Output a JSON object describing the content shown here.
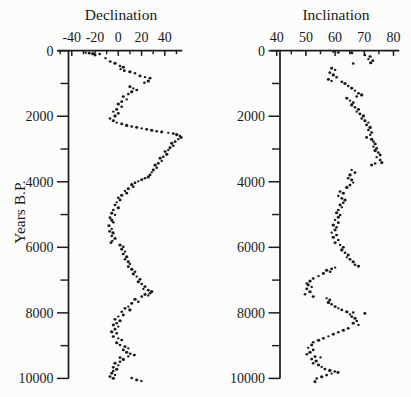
{
  "figure": {
    "background": "#fcfcfb",
    "ink_color": "#1a1a1a"
  },
  "chart_data": [
    {
      "type": "scatter",
      "title": "Declination",
      "ylabel": "Years B.P.",
      "marker": "dot",
      "x_ticks_major": [
        -40,
        -20,
        0,
        20,
        40
      ],
      "x_ticks_minor": [
        -50,
        -30,
        -10,
        10,
        30,
        50
      ],
      "x_range": [
        -52,
        55
      ],
      "y_ticks_major": [
        0,
        2000,
        4000,
        6000,
        8000,
        10000
      ],
      "y_ticks_minor": [
        1000,
        3000,
        5000,
        7000,
        9000
      ],
      "y_range": [
        0,
        10000
      ],
      "y_axis_side": "left",
      "grid": false,
      "points": [
        [
          -28,
          60
        ],
        [
          -25,
          75
        ],
        [
          -22,
          90
        ],
        [
          -16,
          100
        ],
        [
          -20,
          135
        ],
        [
          -11,
          230
        ],
        [
          -7,
          330
        ],
        [
          -2.8,
          385
        ],
        [
          1.5,
          465
        ],
        [
          4.3,
          505
        ],
        [
          2,
          565
        ],
        [
          5.2,
          610
        ],
        [
          10,
          640
        ],
        [
          14.4,
          690
        ],
        [
          18.7,
          770
        ],
        [
          23,
          810
        ],
        [
          27.3,
          840
        ],
        [
          25.8,
          925
        ],
        [
          22.4,
          975
        ],
        [
          10,
          1100
        ],
        [
          12.9,
          1150
        ],
        [
          15.8,
          1200
        ],
        [
          11.5,
          1250
        ],
        [
          8.6,
          1320
        ],
        [
          4.3,
          1400
        ],
        [
          7.2,
          1485
        ],
        [
          2.9,
          1555
        ],
        [
          0,
          1625
        ],
        [
          2.9,
          1710
        ],
        [
          -1.4,
          1790
        ],
        [
          -4.3,
          1860
        ],
        [
          0,
          1910
        ],
        [
          -2.8,
          1990
        ],
        [
          -7.1,
          2065
        ],
        [
          -4.3,
          2135
        ],
        [
          -1.4,
          2195
        ],
        [
          2.9,
          2235
        ],
        [
          7.2,
          2280
        ],
        [
          11.5,
          2310
        ],
        [
          15.8,
          2340
        ],
        [
          20.1,
          2370
        ],
        [
          24.4,
          2400
        ],
        [
          28.7,
          2430
        ],
        [
          33,
          2460
        ],
        [
          37.3,
          2480
        ],
        [
          43,
          2505
        ],
        [
          47.3,
          2530
        ],
        [
          50.2,
          2560
        ],
        [
          53,
          2600
        ],
        [
          54,
          2650
        ],
        [
          51.6,
          2700
        ],
        [
          48.8,
          2775
        ],
        [
          45.9,
          2825
        ],
        [
          47.3,
          2900
        ],
        [
          44.5,
          2960
        ],
        [
          43,
          3030
        ],
        [
          40.2,
          3080
        ],
        [
          41.6,
          3160
        ],
        [
          38.7,
          3235
        ],
        [
          35.9,
          3285
        ],
        [
          37.3,
          3365
        ],
        [
          34.4,
          3435
        ],
        [
          31.6,
          3490
        ],
        [
          33,
          3570
        ],
        [
          30.1,
          3640
        ],
        [
          28.7,
          3710
        ],
        [
          27.3,
          3790
        ],
        [
          25.8,
          3850
        ],
        [
          23,
          3895
        ],
        [
          20.1,
          3940
        ],
        [
          17.2,
          3985
        ],
        [
          14.4,
          4030
        ],
        [
          11.5,
          4085
        ],
        [
          12.9,
          4150
        ],
        [
          8.6,
          4210
        ],
        [
          5.8,
          4280
        ],
        [
          7.2,
          4350
        ],
        [
          2.9,
          4410
        ],
        [
          0,
          4485
        ],
        [
          1.5,
          4555
        ],
        [
          -1.4,
          4625
        ],
        [
          -2.8,
          4710
        ],
        [
          0,
          4790
        ],
        [
          -4.3,
          4860
        ],
        [
          -5.7,
          4960
        ],
        [
          -2.8,
          5010
        ],
        [
          -7.1,
          5095
        ],
        [
          -5.7,
          5170
        ],
        [
          -4.3,
          5235
        ],
        [
          -8,
          5340
        ],
        [
          -5.7,
          5440
        ],
        [
          -7.5,
          5510
        ],
        [
          -4.6,
          5560
        ],
        [
          -5.7,
          5650
        ],
        [
          -2.8,
          5730
        ],
        [
          -5.1,
          5800
        ],
        [
          -6.3,
          5860
        ],
        [
          1.5,
          5930
        ],
        [
          4.3,
          5980
        ],
        [
          2.9,
          6060
        ],
        [
          5.8,
          6135
        ],
        [
          4.3,
          6205
        ],
        [
          7.2,
          6285
        ],
        [
          5.8,
          6365
        ],
        [
          8.6,
          6440
        ],
        [
          10,
          6510
        ],
        [
          8.6,
          6590
        ],
        [
          11.5,
          6670
        ],
        [
          14.4,
          6745
        ],
        [
          12.9,
          6815
        ],
        [
          15.8,
          6895
        ],
        [
          18.7,
          6975
        ],
        [
          17.2,
          7050
        ],
        [
          20.1,
          7120
        ],
        [
          23,
          7200
        ],
        [
          21.5,
          7270
        ],
        [
          25.8,
          7310
        ],
        [
          28.7,
          7350
        ],
        [
          27.3,
          7400
        ],
        [
          23,
          7440
        ],
        [
          25.8,
          7470
        ],
        [
          20.1,
          7505
        ],
        [
          14.4,
          7585
        ],
        [
          17.2,
          7660
        ],
        [
          11.5,
          7710
        ],
        [
          8.6,
          7810
        ],
        [
          5.8,
          7860
        ],
        [
          10,
          7910
        ],
        [
          2.9,
          7965
        ],
        [
          4.3,
          8065
        ],
        [
          0,
          8115
        ],
        [
          -2.8,
          8195
        ],
        [
          1.5,
          8240
        ],
        [
          -1.4,
          8320
        ],
        [
          -4.3,
          8370
        ],
        [
          0,
          8420
        ],
        [
          -2.8,
          8500
        ],
        [
          -5.7,
          8575
        ],
        [
          -1.4,
          8625
        ],
        [
          -4.3,
          8725
        ],
        [
          0,
          8775
        ],
        [
          2.9,
          8830
        ],
        [
          -1.4,
          8910
        ],
        [
          1.5,
          8980
        ],
        [
          5.8,
          9030
        ],
        [
          8.6,
          9080
        ],
        [
          4.3,
          9130
        ],
        [
          7.2,
          9200
        ],
        [
          10.3,
          9250
        ],
        [
          13.8,
          9290
        ],
        [
          8.6,
          9330
        ],
        [
          1.5,
          9365
        ],
        [
          4.3,
          9420
        ],
        [
          1.5,
          9490
        ],
        [
          -2.8,
          9540
        ],
        [
          0,
          9600
        ],
        [
          -4.3,
          9660
        ],
        [
          -1.4,
          9720
        ],
        [
          -4.3,
          9770
        ],
        [
          -5.7,
          9845
        ],
        [
          -2.8,
          9895
        ],
        [
          -7.1,
          9945
        ],
        [
          -4.3,
          9995
        ],
        [
          11.5,
          9990
        ],
        [
          15.8,
          10050
        ],
        [
          19.8,
          10080
        ]
      ]
    },
    {
      "type": "scatter",
      "title": "Inclination",
      "ylabel": "",
      "marker": "dot",
      "x_ticks_major": [
        40,
        50,
        60,
        70,
        80
      ],
      "x_ticks_minor": [
        45,
        55,
        65,
        75
      ],
      "x_range": [
        38,
        82
      ],
      "y_ticks_major": [
        0,
        2000,
        4000,
        6000,
        8000,
        10000
      ],
      "y_ticks_minor": [
        1000,
        3000,
        5000,
        7000,
        9000
      ],
      "y_range": [
        0,
        10000
      ],
      "y_axis_side": "left",
      "grid": false,
      "points": [
        [
          59.4,
          30
        ],
        [
          61.1,
          55
        ],
        [
          65.7,
          65
        ],
        [
          70.2,
          130
        ],
        [
          72,
          180
        ],
        [
          71.4,
          260
        ],
        [
          72.9,
          305
        ],
        [
          72.2,
          365
        ],
        [
          66.2,
          390
        ],
        [
          58.8,
          535
        ],
        [
          60,
          590
        ],
        [
          58.2,
          670
        ],
        [
          59.4,
          740
        ],
        [
          60.5,
          810
        ],
        [
          57.7,
          875
        ],
        [
          58.8,
          925
        ],
        [
          62.3,
          950
        ],
        [
          63.4,
          1000
        ],
        [
          64.5,
          1075
        ],
        [
          65.7,
          1145
        ],
        [
          66.8,
          1220
        ],
        [
          68,
          1300
        ],
        [
          69.1,
          1350
        ],
        [
          67.4,
          1400
        ],
        [
          64,
          1450
        ],
        [
          65.1,
          1525
        ],
        [
          66.2,
          1585
        ],
        [
          65.7,
          1655
        ],
        [
          66.8,
          1725
        ],
        [
          68,
          1790
        ],
        [
          67.4,
          1860
        ],
        [
          68.5,
          1930
        ],
        [
          69.7,
          1990
        ],
        [
          69.1,
          2065
        ],
        [
          70.2,
          2135
        ],
        [
          71.4,
          2195
        ],
        [
          70.8,
          2265
        ],
        [
          72,
          2340
        ],
        [
          71.4,
          2420
        ],
        [
          72.5,
          2500
        ],
        [
          72,
          2570
        ],
        [
          70.8,
          2645
        ],
        [
          72.5,
          2705
        ],
        [
          73.1,
          2775
        ],
        [
          73.7,
          2845
        ],
        [
          73.1,
          2930
        ],
        [
          74.2,
          2980
        ],
        [
          73.7,
          3050
        ],
        [
          74.8,
          3110
        ],
        [
          75.4,
          3180
        ],
        [
          74.2,
          3250
        ],
        [
          75.4,
          3335
        ],
        [
          76,
          3415
        ],
        [
          73.7,
          3445
        ],
        [
          72.5,
          3490
        ],
        [
          65.7,
          3640
        ],
        [
          66.8,
          3720
        ],
        [
          65.1,
          3790
        ],
        [
          64.5,
          3895
        ],
        [
          65.7,
          3945
        ],
        [
          66.2,
          4025
        ],
        [
          65.1,
          4100
        ],
        [
          64,
          4170
        ],
        [
          61.7,
          4300
        ],
        [
          62.8,
          4350
        ],
        [
          61.1,
          4435
        ],
        [
          62.3,
          4505
        ],
        [
          63.4,
          4555
        ],
        [
          62.8,
          4640
        ],
        [
          61.7,
          4710
        ],
        [
          62.3,
          4780
        ],
        [
          61.1,
          4860
        ],
        [
          60.5,
          4945
        ],
        [
          61.7,
          5015
        ],
        [
          61.1,
          5085
        ],
        [
          60,
          5165
        ],
        [
          61.1,
          5250
        ],
        [
          59.4,
          5320
        ],
        [
          60.5,
          5390
        ],
        [
          60,
          5470
        ],
        [
          58.8,
          5555
        ],
        [
          60.5,
          5625
        ],
        [
          59.4,
          5695
        ],
        [
          61.1,
          5775
        ],
        [
          60,
          5860
        ],
        [
          61.7,
          5930
        ],
        [
          62.8,
          6000
        ],
        [
          62.3,
          6080
        ],
        [
          63.4,
          6165
        ],
        [
          64.5,
          6235
        ],
        [
          64,
          6305
        ],
        [
          65.1,
          6365
        ],
        [
          66.2,
          6440
        ],
        [
          66.8,
          6530
        ],
        [
          68,
          6580
        ],
        [
          60,
          6620
        ],
        [
          58.8,
          6660
        ],
        [
          57.1,
          6700
        ],
        [
          58.3,
          6745
        ],
        [
          56,
          6800
        ],
        [
          54.3,
          6880
        ],
        [
          52.5,
          6950
        ],
        [
          51.4,
          7030
        ],
        [
          50.3,
          7100
        ],
        [
          50.8,
          7150
        ],
        [
          52,
          7210
        ],
        [
          50.3,
          7270
        ],
        [
          51.4,
          7355
        ],
        [
          49.7,
          7430
        ],
        [
          52.5,
          7505
        ],
        [
          57.1,
          7555
        ],
        [
          58.2,
          7605
        ],
        [
          57.7,
          7680
        ],
        [
          58.8,
          7740
        ],
        [
          60,
          7810
        ],
        [
          61.1,
          7860
        ],
        [
          62.3,
          7910
        ],
        [
          64,
          7965
        ],
        [
          66.2,
          7985
        ],
        [
          70.2,
          8015
        ],
        [
          65.1,
          8045
        ],
        [
          65.7,
          8115
        ],
        [
          66.8,
          8165
        ],
        [
          67.4,
          8250
        ],
        [
          66.2,
          8320
        ],
        [
          68,
          8370
        ],
        [
          64.5,
          8470
        ],
        [
          62.8,
          8530
        ],
        [
          61.1,
          8590
        ],
        [
          59.4,
          8655
        ],
        [
          57.7,
          8715
        ],
        [
          56,
          8775
        ],
        [
          54.3,
          8835
        ],
        [
          52.5,
          8895
        ],
        [
          52,
          8980
        ],
        [
          50.8,
          9065
        ],
        [
          52.5,
          9130
        ],
        [
          51.4,
          9205
        ],
        [
          50.3,
          9265
        ],
        [
          53.1,
          9335
        ],
        [
          55,
          9360
        ],
        [
          52,
          9410
        ],
        [
          53.5,
          9470
        ],
        [
          52.5,
          9540
        ],
        [
          54.3,
          9590
        ],
        [
          55.4,
          9650
        ],
        [
          56.5,
          9715
        ],
        [
          58.2,
          9755
        ],
        [
          59.9,
          9790
        ],
        [
          61,
          9820
        ],
        [
          58.8,
          9855
        ],
        [
          57.1,
          9900
        ],
        [
          55.4,
          9950
        ],
        [
          53.7,
          10000
        ],
        [
          53.1,
          10100
        ]
      ]
    }
  ]
}
